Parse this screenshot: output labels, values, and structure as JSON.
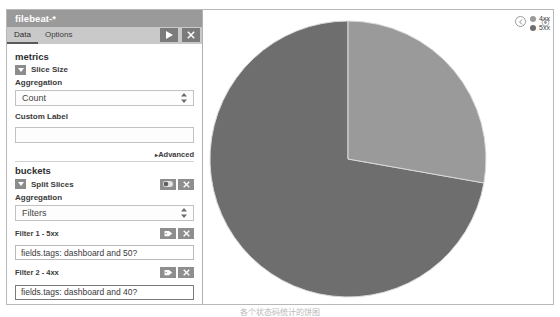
{
  "window": {
    "index_pattern_title": "filebeat-*",
    "gear_icon": "gear-icon"
  },
  "tabs": [
    {
      "label": "Data",
      "active": true
    },
    {
      "label": "Options",
      "active": false
    }
  ],
  "tab_actions": {
    "apply_label": "apply-changes",
    "apply_icon": "play-icon",
    "discard_label": "discard-changes",
    "discard_icon": "close-icon"
  },
  "metrics": {
    "heading": "metrics",
    "slice_size": {
      "label": "Slice Size",
      "collapse_icon": "caret-down-icon",
      "aggregation_label": "Aggregation",
      "aggregation_value": "Count",
      "custom_label_label": "Custom Label",
      "custom_label_value": "",
      "custom_label_placeholder": "",
      "advanced_label": "Advanced",
      "advanced_icon": "caret-right-icon"
    }
  },
  "buckets": {
    "heading": "buckets",
    "split_slices": {
      "label": "Split Slices",
      "collapse_icon": "caret-down-icon",
      "toggle_icon": "toggle-icon",
      "remove_icon": "close-icon",
      "aggregation_label": "Aggregation",
      "aggregation_value": "Filters"
    },
    "filters": [
      {
        "title": "Filter 1 - 5xx",
        "query": "fields.tags: dashboard and 50?",
        "label_icon": "tag-icon",
        "remove_icon": "close-icon",
        "focused": false
      },
      {
        "title": "Filter 2 - 4xx",
        "query": "fields.tags: dashboard and 40?",
        "label_icon": "tag-icon",
        "remove_icon": "close-icon",
        "focused": true
      }
    ],
    "add_filter_label": "Add Filter"
  },
  "legend": {
    "toggle_icon": "legend-toggle-icon",
    "items": [
      {
        "label": "4xx",
        "color": "#9a9a9a"
      },
      {
        "label": "5xx",
        "color": "#6e6e6e"
      }
    ]
  },
  "chart_data": {
    "type": "pie",
    "title": "",
    "labels": [
      "5xx",
      "4xx"
    ],
    "values": [
      73,
      27
    ],
    "colors": [
      "#6e6e6e",
      "#9a9a9a"
    ],
    "start_angle_deg": 0,
    "legend_position": "top-right",
    "grid": false,
    "slices": [
      {
        "label": "5xx",
        "value": 73,
        "start_deg": 100,
        "end_deg": 360,
        "color": "#6e6e6e"
      },
      {
        "label": "4xx",
        "value": 27,
        "start_deg": 0,
        "end_deg": 100,
        "color": "#9a9a9a"
      }
    ]
  },
  "caption": {
    "text": "各个状态码统计的饼图"
  }
}
